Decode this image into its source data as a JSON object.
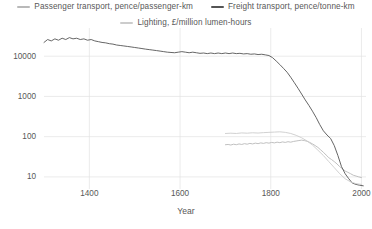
{
  "chart_data": {
    "type": "line",
    "title": "",
    "subtitle": "",
    "xlabel": "Year",
    "ylabel": "",
    "yscale": "log",
    "xlim": [
      1300,
      2010
    ],
    "ylim": [
      5,
      40000
    ],
    "grid": true,
    "legend_position": "top",
    "yticks": [
      10,
      100,
      1000,
      10000
    ],
    "ytick_labels": [
      "10",
      "100",
      "1000",
      "10000"
    ],
    "xticks": [
      1400,
      1600,
      1800,
      2000
    ],
    "xtick_labels": [
      "1400",
      "1600",
      "1800",
      "2000"
    ],
    "series": [
      {
        "name": "Passenger transport, pence/passenger-km",
        "color": "#b9b9b9",
        "x": [
          1700,
          1706,
          1712,
          1718,
          1724,
          1730,
          1736,
          1742,
          1748,
          1754,
          1760,
          1766,
          1772,
          1778,
          1784,
          1790,
          1796,
          1802,
          1808,
          1814,
          1820,
          1826,
          1832,
          1838,
          1844,
          1850,
          1856,
          1862,
          1868,
          1874,
          1880,
          1886,
          1892,
          1898,
          1904,
          1910,
          1916,
          1922,
          1928,
          1934,
          1940,
          1946,
          1952,
          1958,
          1964,
          1970,
          1976,
          1982,
          1988,
          1994,
          2000
        ],
        "y": [
          63,
          64,
          62,
          65,
          63,
          66,
          64,
          67,
          65,
          68,
          66,
          69,
          67,
          70,
          68,
          71,
          69,
          72,
          70,
          73,
          71,
          74,
          72,
          75,
          73,
          76,
          78,
          80,
          82,
          80,
          77,
          72,
          66,
          60,
          54,
          47,
          41,
          35,
          30,
          27,
          24,
          21,
          18,
          16,
          14,
          13,
          12,
          11,
          10.5,
          10,
          9.6
        ]
      },
      {
        "name": "Freight transport, pence/tonne-km",
        "color": "#555555",
        "x": [
          1300,
          1308,
          1316,
          1324,
          1332,
          1340,
          1348,
          1356,
          1364,
          1372,
          1380,
          1388,
          1396,
          1404,
          1412,
          1420,
          1428,
          1436,
          1444,
          1452,
          1460,
          1468,
          1476,
          1484,
          1492,
          1500,
          1508,
          1516,
          1524,
          1532,
          1540,
          1548,
          1556,
          1564,
          1572,
          1580,
          1588,
          1596,
          1604,
          1612,
          1620,
          1628,
          1636,
          1644,
          1652,
          1660,
          1668,
          1676,
          1684,
          1692,
          1700,
          1708,
          1716,
          1724,
          1732,
          1740,
          1748,
          1756,
          1764,
          1772,
          1780,
          1788,
          1796,
          1804,
          1812,
          1820,
          1828,
          1836,
          1844,
          1852,
          1860,
          1868,
          1876,
          1884,
          1892,
          1900,
          1908,
          1916,
          1924,
          1932,
          1940,
          1948,
          1956,
          1964,
          1972,
          1980,
          1988,
          1996,
          2004
        ],
        "y": [
          22000,
          26000,
          24000,
          27000,
          25000,
          28000,
          26000,
          29000,
          27000,
          28000,
          26000,
          27000,
          25000,
          26000,
          24000,
          23000,
          22000,
          21500,
          20500,
          20000,
          19000,
          18500,
          18000,
          17500,
          17000,
          16500,
          16000,
          15500,
          15000,
          14600,
          14200,
          13800,
          13400,
          13000,
          12600,
          12400,
          12200,
          12600,
          13000,
          12600,
          12200,
          12600,
          12200,
          11800,
          12000,
          11600,
          12000,
          11600,
          12000,
          11600,
          12000,
          11600,
          12000,
          11600,
          11800,
          11400,
          11600,
          11200,
          11400,
          11000,
          11200,
          10800,
          10400,
          9200,
          7600,
          6200,
          5000,
          4000,
          3000,
          2200,
          1600,
          1150,
          820,
          600,
          430,
          300,
          200,
          140,
          110,
          90,
          60,
          34,
          18,
          12,
          9,
          7,
          6.5,
          6.2,
          6.0
        ]
      },
      {
        "name": "Lighting, £/million lumen-hours",
        "color": "#cccccc",
        "x": [
          1700,
          1712,
          1724,
          1736,
          1748,
          1760,
          1772,
          1784,
          1796,
          1808,
          1820,
          1832,
          1844,
          1856,
          1868,
          1880,
          1892,
          1904,
          1916,
          1928,
          1940,
          1952,
          1964,
          1976,
          1988,
          2000
        ],
        "y": [
          120,
          122,
          120,
          124,
          122,
          125,
          123,
          126,
          128,
          130,
          132,
          128,
          120,
          108,
          94,
          78,
          62,
          46,
          34,
          24,
          17,
          12,
          9,
          7.5,
          6.8,
          6.5
        ]
      }
    ]
  },
  "legend": {
    "items": [
      {
        "label": "Passenger transport, pence/passenger-km",
        "color": "#b9b9b9"
      },
      {
        "label": "Freight transport, pence/tonne-km",
        "color": "#555555"
      },
      {
        "label": "Lighting, £/million lumen-hours",
        "color": "#cccccc"
      }
    ]
  },
  "axes": {
    "x_title": "Year",
    "y_tick_labels": [
      "10000",
      "1000",
      "100",
      "10"
    ],
    "x_tick_labels": [
      "1400",
      "1600",
      "1800",
      "2000"
    ]
  }
}
